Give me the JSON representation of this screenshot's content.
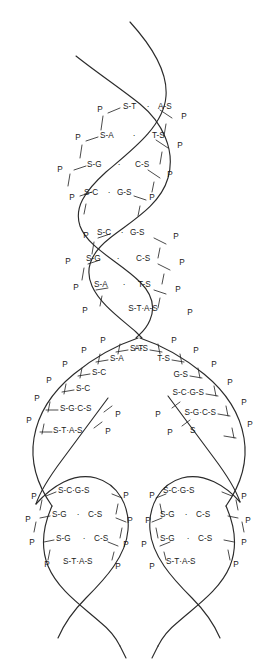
{
  "figure": {
    "stroke_color": "#2b2b2b",
    "text_color": "#1a1a1a",
    "background_color": "#ffffff",
    "width": 277,
    "height": 659
  },
  "legend_symbols": {
    "phosphate": "P",
    "sugar": "S",
    "adenine": "A",
    "thymine": "T",
    "guanine": "G",
    "cytosine": "C",
    "hydrogen_bond": "·"
  },
  "segments": [
    {
      "name": "parent-helix-turn-1",
      "rows": [
        {
          "left_p": "P",
          "left_unit": "S-T",
          "bond": "·",
          "right_unit": "A-S",
          "right_p": "P"
        },
        {
          "left_p": "P",
          "left_unit": "S-A",
          "bond": "·",
          "right_unit": "T-S",
          "right_p": "P"
        },
        {
          "left_p": "P",
          "left_unit": "S-G",
          "bond": "·",
          "right_unit": "C-S",
          "right_p": "P"
        },
        {
          "left_p": "P",
          "left_unit": "S-C",
          "bond": "·",
          "right_unit": "G-S",
          "right_p": "P"
        }
      ]
    },
    {
      "name": "parent-helix-turn-2",
      "rows": [
        {
          "left_p": "P",
          "left_unit": "S-C",
          "bond": "·",
          "right_unit": "G-S",
          "right_p": "P"
        },
        {
          "left_p": "P",
          "left_unit": "S-G",
          "bond": "·",
          "right_unit": "C-S",
          "right_p": "P"
        },
        {
          "left_p": "P",
          "left_unit": "S-A",
          "bond": "·",
          "right_unit": "T-S",
          "right_p": "P"
        },
        {
          "left_p": "P",
          "left_unit": "S-T",
          "bond": "·",
          "right_unit": "A-S",
          "right_p": "P"
        }
      ]
    },
    {
      "name": "replication-fork-left-template",
      "rows": [
        {
          "left_p": "P",
          "left_unit": "S-T"
        },
        {
          "left_p": "P",
          "left_unit": "S-A"
        },
        {
          "left_p": "P",
          "left_unit": "S-C"
        },
        {
          "left_p": "P",
          "left_unit": "S-C"
        },
        {
          "left_p": "P",
          "left_unit": "S-G·C-S"
        },
        {
          "left_p": "P",
          "left_unit": "S-T·A-S"
        }
      ]
    },
    {
      "name": "replication-fork-right-template",
      "rows": [
        {
          "right_unit": "A-S",
          "right_p": "P"
        },
        {
          "right_unit": "T-S",
          "right_p": "P"
        },
        {
          "right_unit": "G-S",
          "right_p": "P"
        },
        {
          "right_unit": "S-C·G-S",
          "right_p": "P"
        },
        {
          "right_unit": "S-G·C-S",
          "right_p": "P"
        },
        {
          "right_unit": "S",
          "right_p": "P"
        }
      ]
    },
    {
      "name": "daughter-helix-left",
      "rows": [
        {
          "left_p": "P",
          "left_unit": "S-C·G-S",
          "right_p": "P"
        },
        {
          "left_p": "P",
          "left_unit": "S-G",
          "bond": "·",
          "right_unit": "C-S",
          "right_p": "P"
        },
        {
          "left_p": "P",
          "left_unit": "S-G",
          "bond": "·",
          "right_unit": "C-S",
          "right_p": "P"
        },
        {
          "left_p": "P",
          "left_unit": "S-T·A-S",
          "right_p": "P"
        }
      ]
    },
    {
      "name": "daughter-helix-right",
      "rows": [
        {
          "left_p": "P",
          "left_unit": "S-C·G-S",
          "right_p": "P"
        },
        {
          "left_p": "P",
          "left_unit": "S-G",
          "bond": "·",
          "right_unit": "C-S",
          "right_p": "P"
        },
        {
          "left_p": "P",
          "left_unit": "S-G",
          "bond": "·",
          "right_unit": "C-S",
          "right_p": "P"
        },
        {
          "left_p": "P",
          "left_unit": "S-T·A-S",
          "right_p": "P"
        }
      ]
    }
  ],
  "labels": {
    "t1": {
      "p1": "P",
      "u1": "S-T",
      "b1": "·",
      "v1": "A-S",
      "q1": "P",
      "p2": "P",
      "u2": "S-A",
      "b2": "·",
      "v2": "T-S",
      "q2": "P",
      "p3": "P",
      "u3": "S-G",
      "b3": "·",
      "v3": "C-S",
      "q3": "P",
      "p4": "P",
      "u4": "S-C",
      "b4": "·",
      "v4": "G-S",
      "q4": "P"
    },
    "t2": {
      "p1": "P",
      "u1": "S-C",
      "b1": "·",
      "v1": "G-S",
      "q1": "P",
      "p2": "P",
      "u2": "S-G",
      "b2": "·",
      "v2": "C-S",
      "q2": "P",
      "p3": "P",
      "u3": "S-A",
      "b3": "·",
      "v3": "T-S",
      "q3": "P",
      "p4": "P",
      "u4": "S-T·A-S",
      "q4": "P"
    },
    "fork": {
      "lp1": "P",
      "lu1": "S-T",
      "lp2": "P",
      "lu2": "S-A",
      "lp3": "P",
      "lu3": "S-C",
      "lp4": "P",
      "lu4": "S-C",
      "lp5": "P",
      "lu5": "S-G·C-S",
      "lp6": "P",
      "lu6": "S-T·A-S",
      "lnp1": "P",
      "lnp2": "P",
      "rv1": "A-S",
      "rq1": "P",
      "rv2": "T-S",
      "rq2": "P",
      "rv3": "G-S",
      "rq3": "P",
      "rv4": "S-C·G-S",
      "rq4": "P",
      "rv5": "S-G·C-S",
      "rq5": "P",
      "rv6": "S",
      "rq6": "P",
      "rnp1": "P",
      "rnp2": "P"
    },
    "dl": {
      "p1": "P",
      "u1": "S-C·G-S",
      "q1": "P",
      "p2": "P",
      "u2": "S-G",
      "b2": "·",
      "v2": "C-S",
      "q2": "P",
      "p3": "P",
      "u3": "S-G",
      "b3": "·",
      "v3": "C-S",
      "q3": "P",
      "p4": "P",
      "u4": "S-T·A-S",
      "q4": "P"
    },
    "dr": {
      "p1": "P",
      "u1": "S-C·G-S",
      "q1": "P",
      "p2": "P",
      "u2": "S-G",
      "b2": "·",
      "v2": "C-S",
      "q2": "P",
      "p3": "P",
      "u3": "S-G",
      "b3": "·",
      "v3": "C-S",
      "q3": "P",
      "p4": "P",
      "u4": "S-T·A-S",
      "q4": "P"
    }
  }
}
